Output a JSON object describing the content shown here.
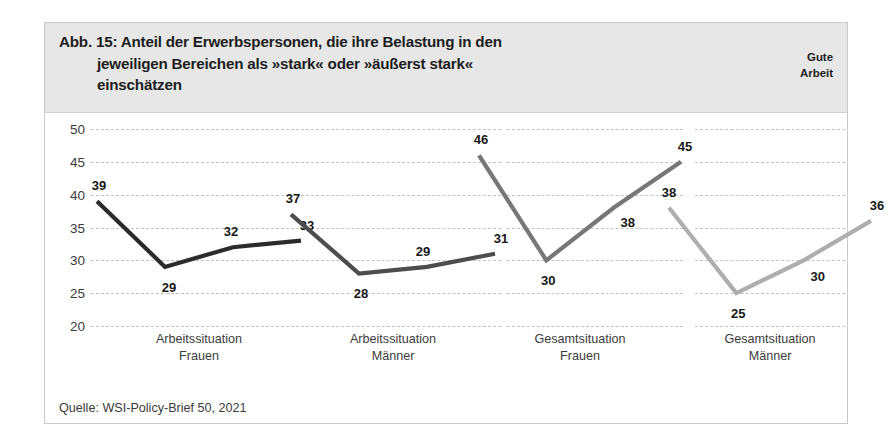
{
  "figure": {
    "title_lines": [
      "Abb. 15: Anteil der Erwerbspersonen, die ihre Belastung in den",
      "jeweiligen Bereichen als »stark« oder »äußerst stark«",
      "einschätzen"
    ],
    "brand_lines": [
      "Gute",
      "Arbeit"
    ],
    "source": "Quelle: WSI-Policy-Brief 50, 2021"
  },
  "chart_data": {
    "type": "line",
    "title": "Abb. 15: Anteil der Erwerbspersonen, die ihre Belastung in den jeweiligen Bereichen als »stark« oder »äußerst stark« einschätzen",
    "xlabel": "",
    "ylabel": "",
    "ylim": [
      20,
      50
    ],
    "yticks": [
      50,
      45,
      40,
      35,
      30,
      25,
      20
    ],
    "grid": true,
    "legend": "none",
    "panels": [
      {
        "label_line1": "Arbeitssituation",
        "label_line2": "Frauen",
        "color": "#2b2b2b",
        "x": [
          1,
          2,
          3,
          4
        ],
        "values": [
          39,
          29,
          32,
          33
        ],
        "point_labels": [
          "39",
          "29",
          "32",
          "33"
        ]
      },
      {
        "label_line1": "Arbeitssituation",
        "label_line2": "Männer",
        "color": "#4d4d4d",
        "x": [
          1,
          2,
          3,
          4
        ],
        "values": [
          37,
          28,
          29,
          31
        ],
        "point_labels": [
          "37",
          "28",
          "29",
          "31"
        ]
      },
      {
        "label_line1": "Gesamtsituation",
        "label_line2": "Frauen",
        "color": "#777777",
        "x": [
          1,
          2,
          3,
          4
        ],
        "values": [
          46,
          30,
          38,
          45
        ],
        "point_labels": [
          "46",
          "30",
          "38",
          "45"
        ]
      },
      {
        "label_line1": "Gesamtsituation",
        "label_line2": "Männer",
        "color": "#aeaeae",
        "x": [
          1,
          2,
          3,
          4
        ],
        "values": [
          38,
          25,
          30,
          36
        ],
        "point_labels": [
          "38",
          "25",
          "30",
          "36"
        ]
      }
    ]
  },
  "colors": {
    "header_band": "#e7e7e7",
    "frame": "#c9c9c9",
    "gridline": "#c3c3c3",
    "text": "#1d1d1d"
  }
}
